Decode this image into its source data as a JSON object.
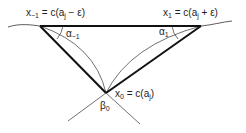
{
  "diagram": {
    "title": "",
    "labels": {
      "x_minus_1": {
        "name": "x",
        "sub": "−1",
        "eq": " = c(a",
        "sub2": "j",
        "rest": " − ε)"
      },
      "x_1": {
        "name": "x",
        "sub": "1",
        "eq": " = c(a",
        "sub2": "j",
        "rest": " + ε)"
      },
      "x_0": {
        "name": "x",
        "sub": "0",
        "eq": " = c(a",
        "sub2": "j",
        "rest": ")"
      },
      "alpha_minus_1": {
        "name": "α",
        "sub": "−1"
      },
      "alpha_1": {
        "name": "α",
        "sub": "1"
      },
      "beta_0": {
        "name": "β",
        "sub": "0"
      }
    },
    "points": {
      "x_minus_1": [
        40,
        26
      ],
      "x_1": [
        201,
        26
      ],
      "x_0": [
        106,
        93
      ]
    },
    "colors": {
      "stroke": "#111111",
      "thin": "#333333",
      "text": "#222222"
    }
  }
}
